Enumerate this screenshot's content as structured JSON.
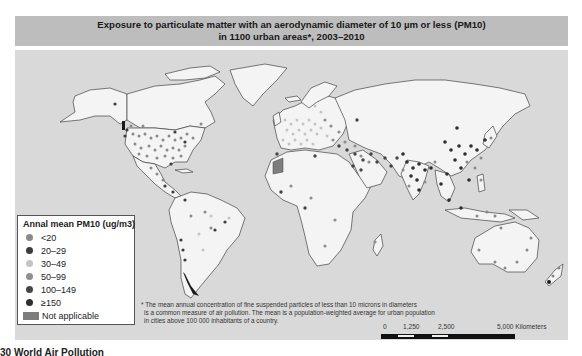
{
  "title": {
    "line1": "Exposure to particulate matter with an aerodynamic diameter of 10 µm or less (PM10)",
    "line2": "in 1100 urban areas*, 2003–2010"
  },
  "legend": {
    "title": "Annal mean PM10 (ug/m3)",
    "items": [
      {
        "label": "<20",
        "color": "#8a8a8a"
      },
      {
        "label": "20–29",
        "color": "#3d3d3d"
      },
      {
        "label": "30–49",
        "color": "#c4c4c4"
      },
      {
        "label": "50–99",
        "color": "#8f8f8f"
      },
      {
        "label": "100–149",
        "color": "#454545"
      },
      {
        "label": "≥150",
        "color": "#2e2e2e"
      }
    ],
    "not_applicable": {
      "label": "Not applicable",
      "color": "#7d7d7d"
    }
  },
  "footnote": {
    "line1": "* The mean annual concentration of fine suspended particles of less than 10 microns in diameters",
    "line2": "is a common measure of air pollution. The mean is a population-weighted average for urban population",
    "line3": "in cities above 100 000 inhabitants of a country."
  },
  "scale_bar": {
    "labels": [
      "0",
      "1,250",
      "2,500",
      "5,000 Kilometers"
    ]
  },
  "caption": "30 World Air Pollution",
  "colors": {
    "ocean": "#d9d9d9",
    "land": "#f4f4f4",
    "border": "#444444",
    "banner": "#bdbdbd"
  }
}
